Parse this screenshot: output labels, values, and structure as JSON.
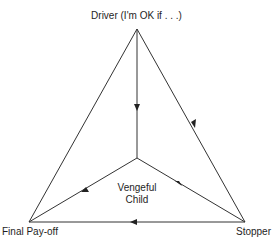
{
  "diagram": {
    "type": "triangle-flow",
    "nodes": {
      "top": {
        "label": "Driver (I'm OK if . . .)"
      },
      "bottom_left": {
        "label": "Final Pay-off"
      },
      "bottom_right": {
        "label": "Stopper"
      },
      "center": {
        "label_line1": "Vengeful",
        "label_line2": "Child"
      }
    },
    "edges": [
      {
        "from": "Driver (I'm OK if . . .)",
        "to": "Vengeful Child",
        "arrow": "down"
      },
      {
        "from": "Driver (I'm OK if . . .)",
        "to": "Stopper",
        "arrow": "toward Stopper"
      },
      {
        "from": "Stopper",
        "to": "Vengeful Child",
        "arrow": "toward center"
      },
      {
        "from": "Vengeful Child",
        "to": "Final Pay-off",
        "arrow": "toward Final Pay-off"
      },
      {
        "from": "Stopper",
        "to": "Final Pay-off",
        "arrow": "left"
      },
      {
        "from": "Driver (I'm OK if . . .)",
        "to": "Final Pay-off",
        "arrow": "none"
      }
    ],
    "line_color": "#333333"
  }
}
